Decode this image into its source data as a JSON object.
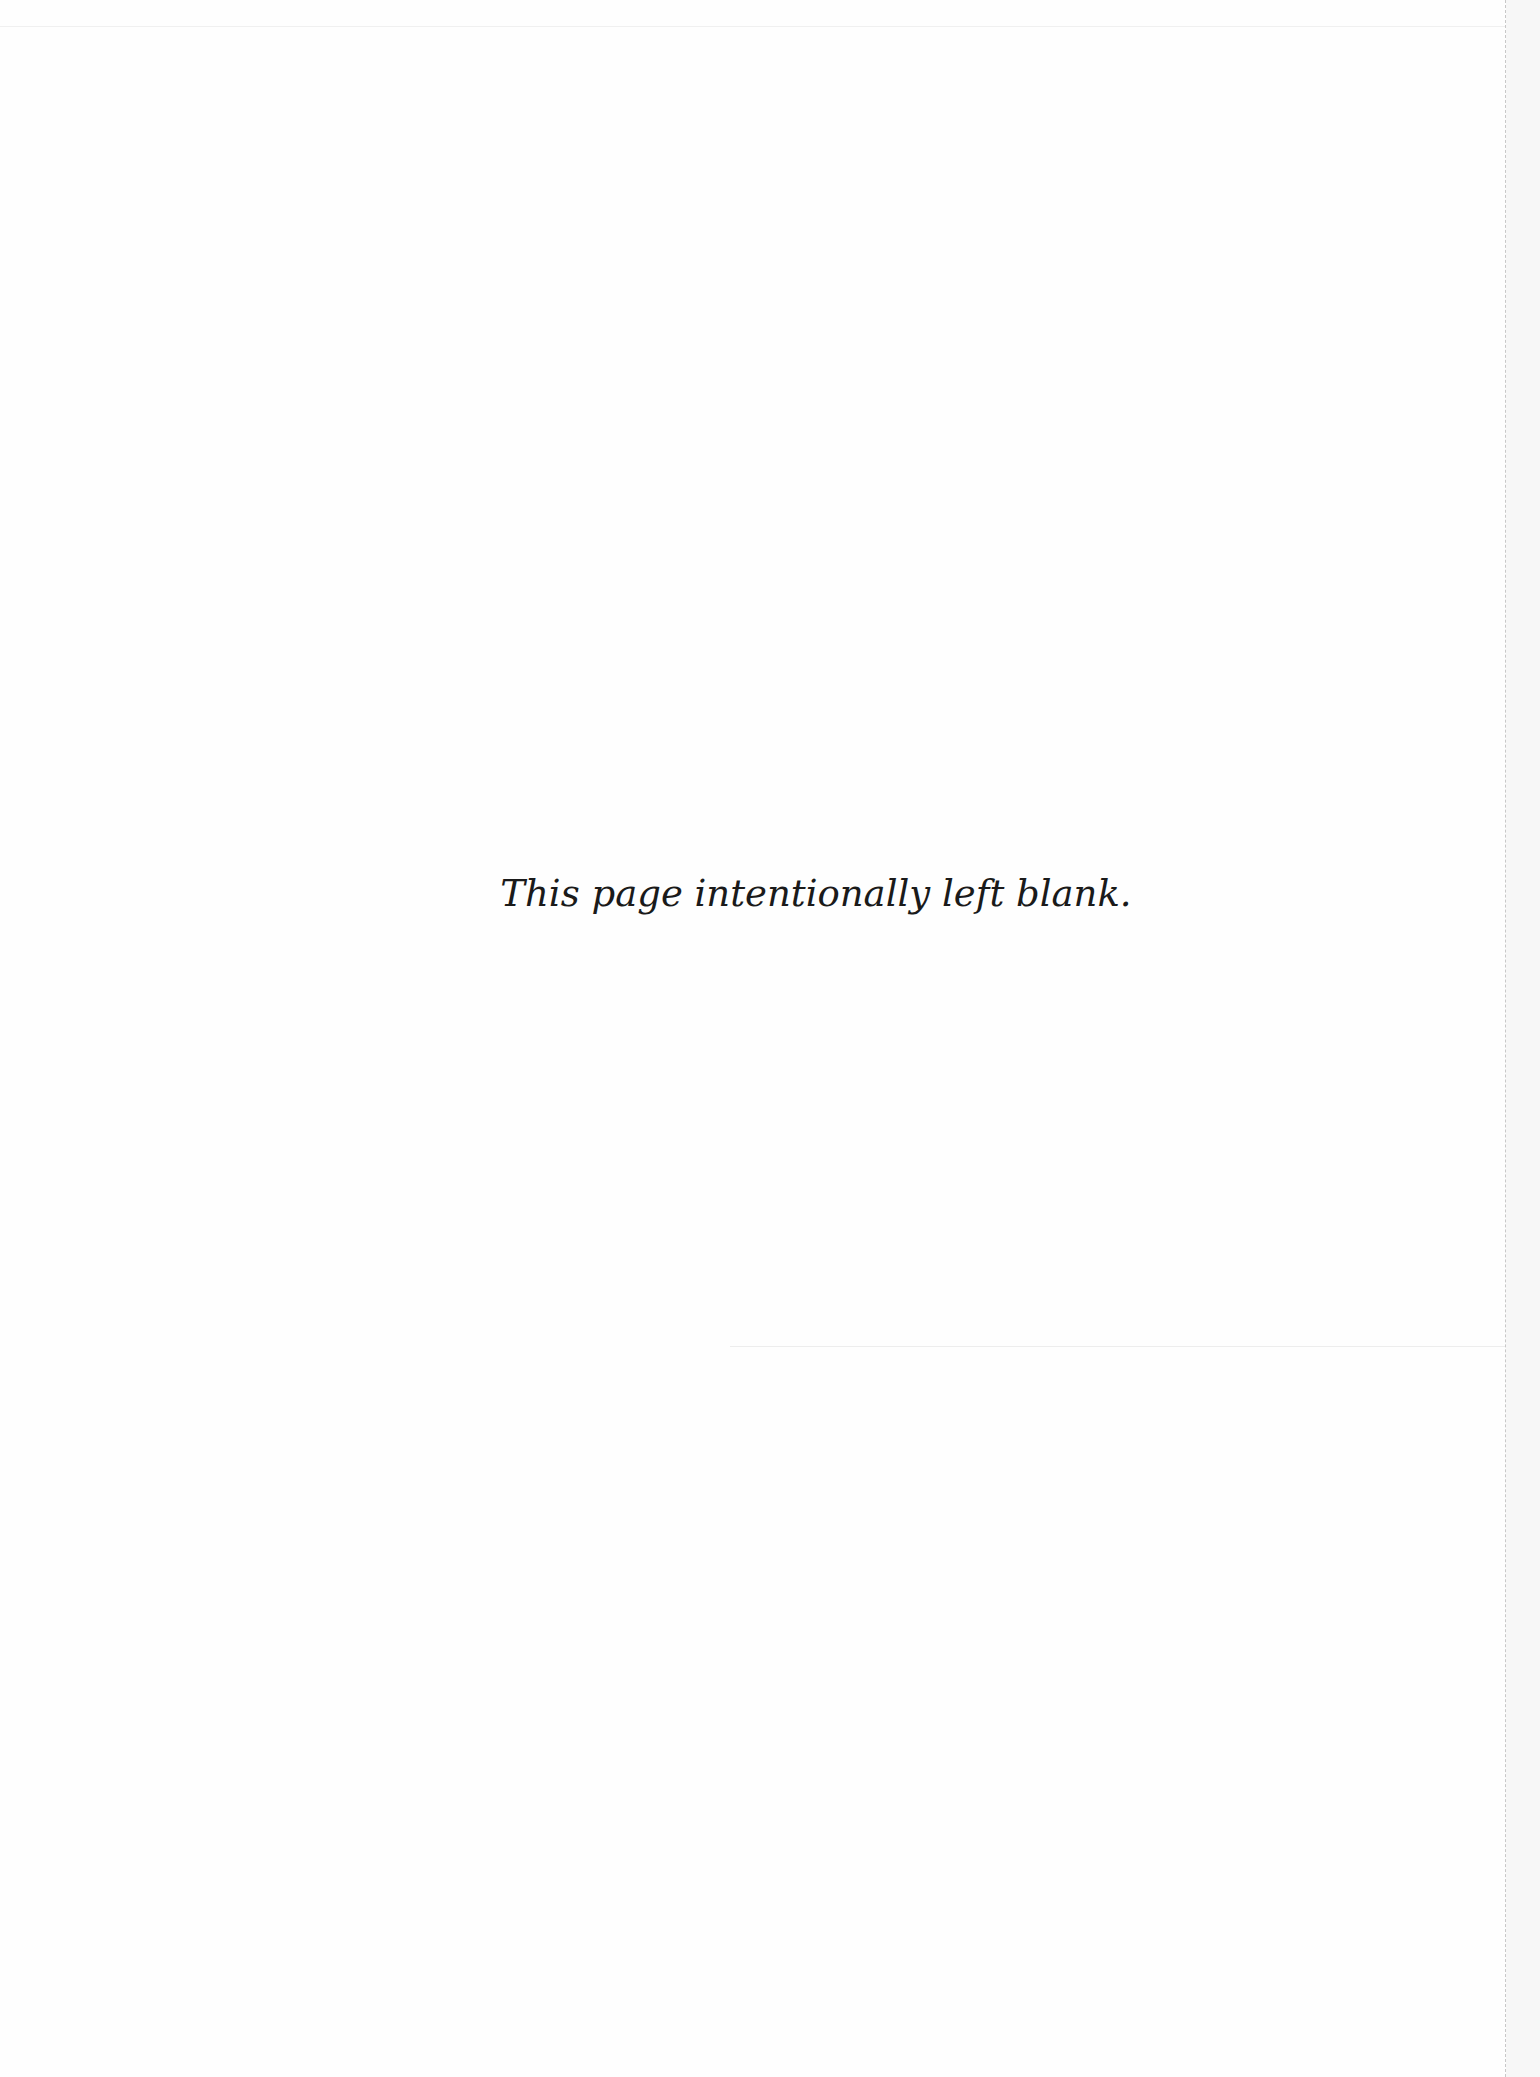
{
  "page": {
    "message": "This page intentionally left blank.",
    "background_color": "#fefefe",
    "text_color": "#1a1a1a"
  }
}
